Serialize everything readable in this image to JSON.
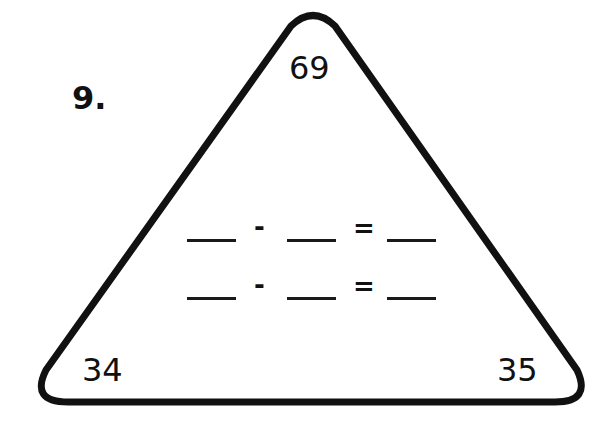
{
  "problem": {
    "number_label": "9.",
    "triangle": {
      "top": "69",
      "bottom_left": "34",
      "bottom_right": "35",
      "stroke_color": "#111111"
    },
    "equations": [
      {
        "blank1": "",
        "operator": "-",
        "blank2": "",
        "equals": "=",
        "blank3": ""
      },
      {
        "blank1": "",
        "operator": "-",
        "blank2": "",
        "equals": "=",
        "blank3": ""
      }
    ]
  }
}
